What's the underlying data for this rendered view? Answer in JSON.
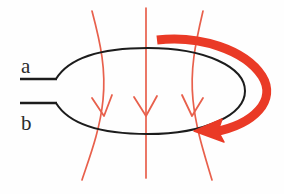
{
  "figure": {
    "kind": "physics-diagram",
    "background_color": "#fefefe",
    "width": 284,
    "height": 194
  },
  "labels": {
    "terminal_a": "a",
    "terminal_b": "b"
  },
  "colors": {
    "wire": "#1c1c1c",
    "lead": "#1c1c1c",
    "field_line": "#e8604c",
    "field_arrowhead": "#e8604c",
    "rotation_arrow": "#ea3a26",
    "label": "#2b2b2b",
    "background": "#fefefe"
  },
  "elements": {
    "loop": {
      "name": "wire-loop-ellipse",
      "shape": "ellipse-with-left-cusp",
      "center_x": 148,
      "center_y": 91,
      "radius_x": 97,
      "radius_y": 43,
      "stroke_width": 2.0
    },
    "leads": {
      "name": "terminal-leads",
      "count": 2,
      "upper": {
        "x1": 20,
        "y1": 79,
        "x2": 56,
        "y2": 79
      },
      "lower": {
        "x1": 20,
        "y1": 103,
        "x2": 56,
        "y2": 103
      },
      "stroke_width": 2.4
    },
    "field_lines": {
      "name": "magnetic-field-lines",
      "count": 3,
      "direction": "downward",
      "arrowhead_style": "open-v",
      "stroke_width": 1.7,
      "lines": [
        {
          "id": "field-line-left",
          "top_x": 92,
          "top_y": 11,
          "bottom_x": 82,
          "bottom_y": 180,
          "bulge_x": 105,
          "arrow_y": 112
        },
        {
          "id": "field-line-center",
          "top_x": 146,
          "top_y": 8,
          "bottom_x": 146,
          "bottom_y": 178,
          "bulge_x": 146,
          "arrow_y": 112
        },
        {
          "id": "field-line-right",
          "top_x": 203,
          "top_y": 11,
          "bottom_x": 212,
          "bottom_y": 180,
          "bulge_x": 196,
          "arrow_y": 112
        }
      ]
    },
    "rotation_arrow": {
      "name": "rotation-direction-arrow",
      "stroke_width": 9,
      "tail": {
        "x": 157,
        "y": 40
      },
      "head": {
        "x": 196,
        "y": 131
      },
      "head_direction": "left",
      "sweep": "clockwise-around-right-side"
    }
  }
}
